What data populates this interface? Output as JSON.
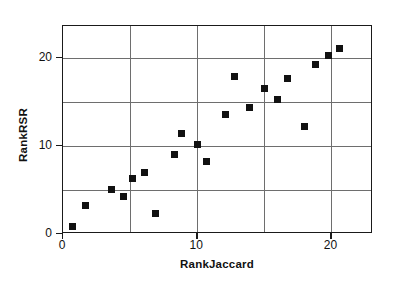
{
  "chart_data": {
    "type": "scatter",
    "title": "",
    "xlabel": "RankJaccard",
    "ylabel": "RankRSR",
    "xlim": [
      0,
      23.1
    ],
    "ylim": [
      0,
      23.6
    ],
    "xticks": [
      0,
      10,
      20
    ],
    "yticks": [
      0,
      10,
      20
    ],
    "xticklabels": [
      "0",
      "10",
      "20"
    ],
    "yticklabels": [
      "0",
      "10",
      "20"
    ],
    "grid": true,
    "grid_x": [
      5,
      10,
      15,
      20
    ],
    "grid_y": [
      5,
      10,
      15,
      20
    ],
    "legend": null,
    "marker": "square",
    "marker_color": "#111111",
    "points": [
      {
        "x": 0.7,
        "y": 0.8
      },
      {
        "x": 1.7,
        "y": 3.2
      },
      {
        "x": 3.6,
        "y": 5.1
      },
      {
        "x": 4.5,
        "y": 4.2
      },
      {
        "x": 5.2,
        "y": 6.3
      },
      {
        "x": 6.1,
        "y": 7.0
      },
      {
        "x": 6.9,
        "y": 2.3
      },
      {
        "x": 8.3,
        "y": 9.0
      },
      {
        "x": 8.8,
        "y": 11.4
      },
      {
        "x": 10.0,
        "y": 10.1
      },
      {
        "x": 10.7,
        "y": 8.2
      },
      {
        "x": 12.1,
        "y": 13.6
      },
      {
        "x": 12.8,
        "y": 17.9
      },
      {
        "x": 13.9,
        "y": 14.4
      },
      {
        "x": 15.0,
        "y": 16.5
      },
      {
        "x": 16.0,
        "y": 15.3
      },
      {
        "x": 16.7,
        "y": 17.6
      },
      {
        "x": 18.0,
        "y": 12.2
      },
      {
        "x": 18.8,
        "y": 19.2
      },
      {
        "x": 19.8,
        "y": 20.2
      },
      {
        "x": 20.6,
        "y": 21.1
      }
    ]
  },
  "axes": {
    "x_title": "RankJaccard",
    "y_title": "RankRSR"
  }
}
